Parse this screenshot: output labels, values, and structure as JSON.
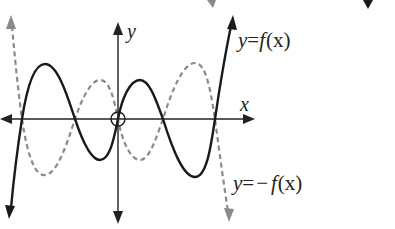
{
  "diagram": {
    "title": "",
    "axes": {
      "x_label": "x",
      "y_label": "y"
    },
    "curves": [
      {
        "name": "f",
        "label_prefix": "y",
        "label_eq": "=",
        "label_func": "f",
        "label_arg": "(x)",
        "style": "solid",
        "color": "#1a1a1a"
      },
      {
        "name": "neg-f",
        "label_prefix": "y",
        "label_eq": "=",
        "label_minus": "−",
        "label_func": "f",
        "label_arg": "(x)",
        "style": "dashed",
        "color": "#8a8a8a"
      }
    ],
    "origin_marker": "circle"
  },
  "colors": {
    "background": "#ffffff",
    "axis": "#222222",
    "solid_curve": "#1a1a1a",
    "dashed_curve": "#8a8a8a"
  }
}
